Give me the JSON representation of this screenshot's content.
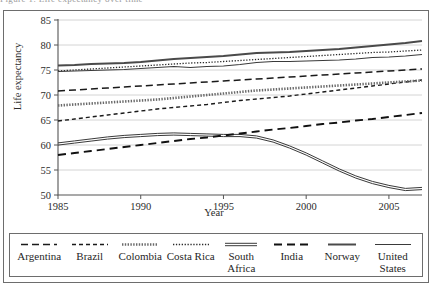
{
  "top_cropped_text": "Figure 1. Life expectancy over time",
  "chart_data": {
    "type": "line",
    "title": "",
    "xlabel": "Year",
    "ylabel": "Life expectancy",
    "xlim": [
      1985,
      2007
    ],
    "ylim": [
      50,
      85
    ],
    "xticks": [
      1985,
      1990,
      1995,
      2000,
      2005
    ],
    "yticks": [
      50,
      55,
      60,
      65,
      70,
      75,
      80,
      85
    ],
    "grid": "horizontal",
    "legend_position": "bottom",
    "x": [
      1985,
      1986,
      1987,
      1988,
      1989,
      1990,
      1991,
      1992,
      1993,
      1994,
      1995,
      1996,
      1997,
      1998,
      1999,
      2000,
      2001,
      2002,
      2003,
      2004,
      2005,
      2006,
      2007
    ],
    "series": [
      {
        "name": "Argentina",
        "style": "long-dash",
        "values": [
          70.8,
          71.0,
          71.2,
          71.4,
          71.6,
          71.8,
          72.0,
          72.2,
          72.4,
          72.6,
          72.8,
          73.0,
          73.2,
          73.4,
          73.6,
          73.8,
          74.0,
          74.2,
          74.4,
          74.6,
          74.8,
          75.0,
          75.2
        ]
      },
      {
        "name": "Brazil",
        "style": "short-dash",
        "values": [
          64.8,
          65.2,
          65.6,
          66.0,
          66.4,
          66.8,
          67.2,
          67.5,
          67.8,
          68.1,
          68.5,
          68.9,
          69.2,
          69.5,
          69.8,
          70.2,
          70.6,
          71.0,
          71.4,
          71.8,
          72.2,
          72.6,
          73.0
        ]
      },
      {
        "name": "Colombia",
        "style": "circle-chain",
        "values": [
          67.9,
          68.1,
          68.3,
          68.5,
          68.7,
          68.9,
          69.1,
          69.4,
          69.7,
          70.0,
          70.3,
          70.6,
          70.9,
          71.1,
          71.3,
          71.5,
          71.7,
          71.9,
          72.1,
          72.3,
          72.5,
          72.7,
          72.9
        ]
      },
      {
        "name": "Costa Rica",
        "style": "fine-dot",
        "values": [
          74.8,
          75.0,
          75.2,
          75.4,
          75.6,
          75.8,
          76.0,
          76.2,
          76.4,
          76.5,
          76.7,
          76.9,
          77.1,
          77.3,
          77.5,
          77.7,
          77.9,
          78.1,
          78.3,
          78.5,
          78.6,
          78.8,
          79.0
        ]
      },
      {
        "name": "South Africa",
        "style": "double-line",
        "values": [
          60.2,
          60.6,
          61.0,
          61.4,
          61.7,
          61.9,
          62.1,
          62.2,
          62.1,
          62.0,
          61.9,
          61.9,
          61.6,
          60.8,
          59.6,
          58.2,
          56.6,
          55.0,
          53.6,
          52.5,
          51.7,
          51.1,
          51.3
        ]
      },
      {
        "name": "India",
        "style": "thick-long-dash",
        "values": [
          58.0,
          58.4,
          58.8,
          59.2,
          59.6,
          60.0,
          60.4,
          60.8,
          61.2,
          61.5,
          61.9,
          62.3,
          62.7,
          63.1,
          63.4,
          63.8,
          64.2,
          64.5,
          64.9,
          65.2,
          65.6,
          66.0,
          66.4
        ]
      },
      {
        "name": "Norway",
        "style": "thick-solid",
        "values": [
          75.9,
          76.0,
          76.2,
          76.3,
          76.4,
          76.6,
          76.9,
          77.2,
          77.4,
          77.6,
          77.8,
          78.1,
          78.4,
          78.5,
          78.6,
          78.8,
          79.0,
          79.2,
          79.5,
          79.8,
          80.1,
          80.4,
          80.8
        ]
      },
      {
        "name": "United States",
        "style": "solid",
        "values": [
          74.7,
          74.8,
          74.9,
          75.0,
          75.1,
          75.3,
          75.5,
          75.7,
          75.5,
          75.7,
          75.8,
          76.1,
          76.5,
          76.7,
          76.7,
          76.8,
          76.9,
          77.0,
          77.2,
          77.5,
          77.6,
          77.8,
          78.1
        ]
      }
    ]
  },
  "legend": {
    "items": [
      {
        "label": "Argentina",
        "style": "long-dash"
      },
      {
        "label": "Brazil",
        "style": "short-dash"
      },
      {
        "label": "Colombia",
        "style": "circle-chain"
      },
      {
        "label": "Costa Rica",
        "style": "fine-dot"
      },
      {
        "label": "South Africa",
        "style": "double-line"
      },
      {
        "label": "India",
        "style": "thick-long-dash"
      },
      {
        "label": "Norway",
        "style": "thick-solid"
      },
      {
        "label": "United States",
        "style": "solid"
      }
    ]
  }
}
